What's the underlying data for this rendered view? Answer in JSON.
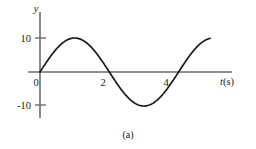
{
  "figure": {
    "caption": "(a)",
    "background_color": "#ffffff",
    "axis_color": "#6b6b6b",
    "curve_color": "#1a1a1a"
  },
  "chart_data": {
    "type": "line",
    "title": "",
    "subtitle": "",
    "xlabel": "t(s)",
    "ylabel": "y",
    "xlabel_variable": "t",
    "xlabel_unit": "(s)",
    "xlim": [
      -0.25,
      6.1
    ],
    "ylim": [
      -17.5,
      17.5
    ],
    "xticks": [
      0,
      2,
      4
    ],
    "xtick_labels": [
      "0",
      "2",
      "4"
    ],
    "yticks": [
      10,
      -10
    ],
    "ytick_labels": [
      "10",
      "-10"
    ],
    "grid": false,
    "legend": false,
    "legend_position": "none",
    "amplitude": 10,
    "period": 4.4,
    "zero_crossings": [
      0,
      2.2,
      4.4
    ],
    "peaks": [
      {
        "x": 1.1,
        "y": 10
      },
      {
        "x": 4.7,
        "y": 10
      }
    ],
    "troughs": [
      {
        "x": 3.3,
        "y": -10
      }
    ],
    "x_start": 0,
    "x_end": 5.4,
    "series": [
      {
        "name": "y(t)",
        "x": [
          0,
          0.15,
          0.3,
          0.45,
          0.6,
          0.75,
          0.9,
          1.05,
          1.2,
          1.35,
          1.5,
          1.65,
          1.8,
          1.95,
          2.1,
          2.2,
          2.35,
          2.5,
          2.65,
          2.8,
          2.95,
          3.1,
          3.25,
          3.4,
          3.55,
          3.7,
          3.85,
          4.0,
          4.15,
          4.3,
          4.4,
          4.55,
          4.7,
          4.85,
          5.0,
          5.15,
          5.3,
          5.4
        ],
        "values": [
          0,
          2.13,
          4.16,
          5.98,
          7.51,
          8.67,
          9.41,
          9.88,
          9.94,
          9.6,
          8.87,
          7.79,
          6.4,
          4.78,
          2.99,
          1.78,
          0.0,
          -2.13,
          -4.16,
          -5.98,
          -7.51,
          -8.67,
          -9.41,
          -9.88,
          -9.94,
          -9.6,
          -8.87,
          -7.79,
          -6.4,
          -4.78,
          0.0,
          4.16,
          7.51,
          9.41,
          9.94,
          8.87,
          6.4,
          4.78
        ]
      }
    ]
  }
}
